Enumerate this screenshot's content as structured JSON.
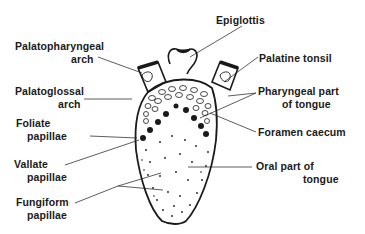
{
  "diagram": {
    "labels": [
      {
        "id": "epiglottis",
        "lines": [
          "Epiglottis"
        ]
      },
      {
        "id": "palatopharyngeal-arch",
        "lines": [
          "Palatopharyngeal",
          "arch"
        ]
      },
      {
        "id": "palatine-tonsil",
        "lines": [
          "Palatine  tonsil"
        ]
      },
      {
        "id": "palatoglossal-arch",
        "lines": [
          "Palatoglossal",
          "arch"
        ]
      },
      {
        "id": "pharyngeal-part",
        "lines": [
          "Pharyngeal  part",
          "of  tongue"
        ]
      },
      {
        "id": "foliate-papillae",
        "lines": [
          "Foliate",
          "papillae"
        ]
      },
      {
        "id": "foramen-caecum",
        "lines": [
          "Foramen  caecum"
        ]
      },
      {
        "id": "vallate-papillae",
        "lines": [
          "Vallate",
          "papillae"
        ]
      },
      {
        "id": "oral-part",
        "lines": [
          "Oral part  of",
          "tongue"
        ]
      },
      {
        "id": "fungiform-papillae",
        "lines": [
          "Fungiform",
          "papillae"
        ]
      }
    ],
    "colors": {
      "ink": "#1a1a1a",
      "background": "#ffffff",
      "leader": "#333333"
    }
  }
}
